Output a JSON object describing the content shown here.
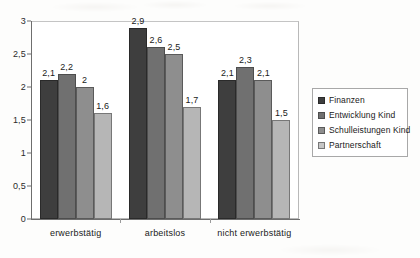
{
  "chart_data": {
    "type": "bar",
    "title": "",
    "subtitle": "",
    "xlabel": "",
    "ylabel": "",
    "categories": [
      "erwerbstätig",
      "arbeitslos",
      "nicht erwerbstätig"
    ],
    "series": [
      {
        "name": "Finanzen",
        "color": "#3e3e3e",
        "values": [
          2.1,
          2.9,
          2.1
        ],
        "labels": [
          "2,1",
          "2,9",
          "2,1"
        ]
      },
      {
        "name": "Entwicklung Kind",
        "color": "#707070",
        "values": [
          2.2,
          2.6,
          2.3
        ],
        "labels": [
          "2,2",
          "2,6",
          "2,3"
        ]
      },
      {
        "name": "Schulleistungen Kind",
        "color": "#8e8e8e",
        "values": [
          2.0,
          2.5,
          2.1
        ],
        "labels": [
          "2",
          "2,5",
          "2,1"
        ]
      },
      {
        "name": "Partnerschaft",
        "color": "#b6b6b6",
        "values": [
          1.6,
          1.7,
          1.5
        ],
        "labels": [
          "1,6",
          "1,7",
          "1,5"
        ]
      }
    ],
    "ylim": [
      0,
      3
    ],
    "ytick_values": [
      3,
      2.5,
      2,
      1.5,
      1,
      0.5,
      0
    ],
    "ytick_labels": [
      "3",
      "2,5",
      "2",
      "1,5",
      "1",
      "0,5",
      "0"
    ],
    "grid": false,
    "legend_position": "right",
    "decimal_separator": ","
  },
  "legend": {
    "items": [
      {
        "label": "Finanzen"
      },
      {
        "label": "Entwicklung Kind"
      },
      {
        "label": "Schulleistungen Kind"
      },
      {
        "label": "Partnerschaft"
      }
    ]
  }
}
